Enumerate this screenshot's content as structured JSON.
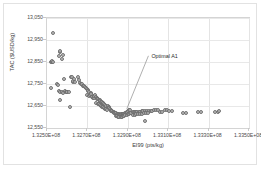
{
  "chart_data": {
    "type": "scatter",
    "title": "",
    "xlabel": "EI99 (pts/kg)",
    "ylabel": "TAC ($USD/kg)",
    "xlim": [
      132500000,
      133500000
    ],
    "ylim": [
      12550,
      13050
    ],
    "x_tick_labels": [
      "1.3250E+08",
      "1.3270E+08",
      "1.3290E+08",
      "1.3310E+08",
      "1.3330E+08",
      "1.3350E+08"
    ],
    "x_tick_values": [
      132500000,
      132700000,
      132900000,
      133100000,
      133300000,
      133500000
    ],
    "y_tick_labels": [
      "12,550",
      "12,650",
      "12,750",
      "12,850",
      "12,950",
      "13,050"
    ],
    "y_tick_values": [
      12550,
      12650,
      12750,
      12850,
      12950,
      13050
    ],
    "grid": {
      "vertical": true,
      "horizontal": true
    },
    "legend": {
      "visible": false,
      "position": "none"
    },
    "marker": {
      "shape": "circle",
      "fill": "#b9b9b9",
      "edge": "#6e6e6e",
      "size": 4
    },
    "annotations": [
      {
        "text": "Optimal A1",
        "label_x": 133012000,
        "label_y": 12869,
        "target_x": 132905000,
        "target_y": 12628
      }
    ],
    "series": [
      {
        "name": "Pareto points",
        "points": [
          [
            132528000,
            12982
          ],
          [
            132519000,
            12852
          ],
          [
            132523000,
            12850
          ],
          [
            132527000,
            12854
          ],
          [
            132531000,
            12851
          ],
          [
            132522000,
            12731
          ],
          [
            132557000,
            12878
          ],
          [
            132563000,
            12897
          ],
          [
            132566000,
            12900
          ],
          [
            132573000,
            12862
          ],
          [
            132581000,
            12884
          ],
          [
            132551000,
            12749
          ],
          [
            132556000,
            12745
          ],
          [
            132561000,
            12717
          ],
          [
            132566000,
            12712
          ],
          [
            132572000,
            12714
          ],
          [
            132578000,
            12709
          ],
          [
            132565000,
            12679
          ],
          [
            132585000,
            12772
          ],
          [
            132588000,
            12716
          ],
          [
            132593000,
            12712
          ],
          [
            132597000,
            12714
          ],
          [
            132601000,
            12713
          ],
          [
            132609000,
            12712
          ],
          [
            132620000,
            12780
          ],
          [
            132624000,
            12783
          ],
          [
            132628000,
            12759
          ],
          [
            132631000,
            12765
          ],
          [
            132635000,
            12771
          ],
          [
            132639000,
            12760
          ],
          [
            132655000,
            12782
          ],
          [
            132660000,
            12768
          ],
          [
            132664000,
            12755
          ],
          [
            132668000,
            12752
          ],
          [
            132672000,
            12748
          ],
          [
            132676000,
            12742
          ],
          [
            132681000,
            12739
          ],
          [
            132612000,
            12645
          ],
          [
            132688000,
            12737
          ],
          [
            132693000,
            12733
          ],
          [
            132697000,
            12726
          ],
          [
            132701000,
            12721
          ],
          [
            132705000,
            12718
          ],
          [
            132710000,
            12715
          ],
          [
            132700000,
            12699
          ],
          [
            132706000,
            12695
          ],
          [
            132712000,
            12700
          ],
          [
            132716000,
            12708
          ],
          [
            132720000,
            12703
          ],
          [
            132723000,
            12692
          ],
          [
            132727000,
            12688
          ],
          [
            132731000,
            12686
          ],
          [
            132735000,
            12697
          ],
          [
            132738000,
            12700
          ],
          [
            132742000,
            12692
          ],
          [
            132746000,
            12688
          ],
          [
            132749000,
            12683
          ],
          [
            132753000,
            12681
          ],
          [
            132757000,
            12678
          ],
          [
            132760000,
            12676
          ],
          [
            132764000,
            12673
          ],
          [
            132768000,
            12670
          ],
          [
            132744000,
            12664
          ],
          [
            132751000,
            12660
          ],
          [
            132756000,
            12658
          ],
          [
            132762000,
            12656
          ],
          [
            132766000,
            12652
          ],
          [
            132771000,
            12668
          ],
          [
            132775000,
            12665
          ],
          [
            132779000,
            12662
          ],
          [
            132783000,
            12659
          ],
          [
            132787000,
            12656
          ],
          [
            132791000,
            12651
          ],
          [
            132773000,
            12647
          ],
          [
            132778000,
            12644
          ],
          [
            132783000,
            12641
          ],
          [
            132788000,
            12638
          ],
          [
            132793000,
            12636
          ],
          [
            132797000,
            12633
          ],
          [
            132801000,
            12648
          ],
          [
            132805000,
            12644
          ],
          [
            132808000,
            12640
          ],
          [
            132812000,
            12636
          ],
          [
            132815000,
            12632
          ],
          [
            132819000,
            12629
          ],
          [
            132823000,
            12626
          ],
          [
            132826000,
            12623
          ],
          [
            132830000,
            12621
          ],
          [
            132834000,
            12619
          ],
          [
            132838000,
            12617
          ],
          [
            132842000,
            12616
          ],
          [
            132846000,
            12614
          ],
          [
            132850000,
            12613
          ],
          [
            132854000,
            12612
          ],
          [
            132858000,
            12611
          ],
          [
            132862000,
            12611
          ],
          [
            132866000,
            12612
          ],
          [
            132870000,
            12613
          ],
          [
            132874000,
            12613
          ],
          [
            132878000,
            12614
          ],
          [
            132882000,
            12615
          ],
          [
            132886000,
            12617
          ],
          [
            132890000,
            12619
          ],
          [
            132894000,
            12621
          ],
          [
            132840000,
            12606
          ],
          [
            132846000,
            12603
          ],
          [
            132852000,
            12601
          ],
          [
            132858000,
            12600
          ],
          [
            132864000,
            12600
          ],
          [
            132870000,
            12601
          ],
          [
            132876000,
            12603
          ],
          [
            132882000,
            12605
          ],
          [
            132888000,
            12607
          ],
          [
            132894000,
            12609
          ],
          [
            132898000,
            12624
          ],
          [
            132903000,
            12627
          ],
          [
            132907000,
            12630
          ],
          [
            132911000,
            12633
          ],
          [
            132900000,
            12612
          ],
          [
            132906000,
            12615
          ],
          [
            132912000,
            12618
          ],
          [
            132918000,
            12620
          ],
          [
            132924000,
            12622
          ],
          [
            132930000,
            12623
          ],
          [
            132936000,
            12624
          ],
          [
            132942000,
            12625
          ],
          [
            132948000,
            12625
          ],
          [
            132954000,
            12625
          ],
          [
            132960000,
            12625
          ],
          [
            132927000,
            12610
          ],
          [
            132935000,
            12611
          ],
          [
            132943000,
            12612
          ],
          [
            132951000,
            12613
          ],
          [
            132959000,
            12614
          ],
          [
            132968000,
            12626
          ],
          [
            132977000,
            12627
          ],
          [
            132986000,
            12627
          ],
          [
            132995000,
            12628
          ],
          [
            133004000,
            12628
          ],
          [
            132972000,
            12615
          ],
          [
            132982000,
            12616
          ],
          [
            132992000,
            12617
          ],
          [
            133002000,
            12618
          ],
          [
            132985000,
            12584
          ],
          [
            133013000,
            12629
          ],
          [
            133022000,
            12629
          ],
          [
            133031000,
            12630
          ],
          [
            133040000,
            12630
          ],
          [
            133049000,
            12630
          ],
          [
            133060000,
            12624
          ],
          [
            133070000,
            12624
          ],
          [
            133082000,
            12630
          ],
          [
            133094000,
            12630
          ],
          [
            133106000,
            12629
          ],
          [
            133118000,
            12629
          ],
          [
            133175000,
            12617
          ],
          [
            133190000,
            12617
          ],
          [
            133248000,
            12621
          ],
          [
            133262000,
            12622
          ],
          [
            133330000,
            12623
          ],
          [
            133348000,
            12624
          ],
          [
            133352000,
            12626
          ]
        ]
      }
    ]
  }
}
